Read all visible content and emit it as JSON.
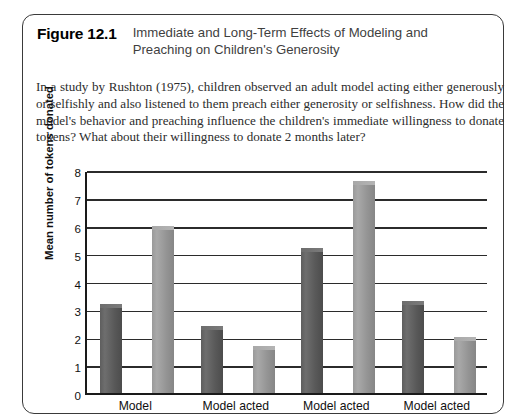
{
  "figure": {
    "number": "Figure 12.1",
    "title": "Immediate and Long-Term Effects of Modeling and Preaching on Children's Generosity",
    "description": "In a study by Rushton (1975), children observed an adult model acting either generously or selfishly and also listened to them preach either generosity or selfishness. How did the model's behavior and preaching influence the children's immediate willingness to donate tokens? What about their willingness to donate 2 months later?"
  },
  "chart_data": {
    "type": "bar",
    "title": "",
    "xlabel": "",
    "ylabel": "Mean number of tokens donated",
    "ylim": [
      0,
      8
    ],
    "yticks": [
      "0",
      "1",
      "2",
      "3",
      "4",
      "5",
      "6",
      "7",
      "8"
    ],
    "grid": true,
    "legend_position": "none",
    "categories": [
      "Model",
      "Model acted",
      "Model acted",
      "Model acted"
    ],
    "series": [
      {
        "name": "dark",
        "values": [
          3.2,
          2.4,
          5.2,
          3.3
        ]
      },
      {
        "name": "light",
        "values": [
          6.0,
          1.7,
          7.6,
          2.0
        ]
      }
    ],
    "colors": {
      "dark": "#5e5e5e",
      "light": "#9a9a9a",
      "axis": "#1a1a1a",
      "grid": "#2b2b2b"
    }
  }
}
